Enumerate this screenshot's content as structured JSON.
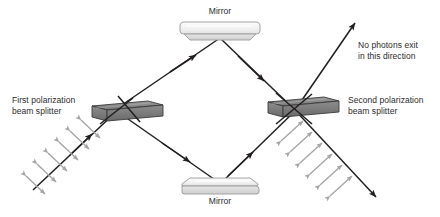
{
  "figure": {
    "background_color": "#ffffff",
    "width": 440,
    "height": 217
  },
  "colors": {
    "beam_line": "#231f20",
    "polarization_arrow": "#a6a6a6",
    "splitter_top_face": "#808080",
    "splitter_front_face": "#707070",
    "splitter_outline": "#3a3a3a",
    "mirror_face": "#f2f2f2",
    "mirror_edge": "#d9d9d9",
    "mirror_outline": "#808080",
    "text": "#2b2b2b"
  },
  "labels": {
    "mirror_top": "Mirror",
    "mirror_bottom": "Mirror",
    "first_splitter_line1": "First polarization",
    "first_splitter_line2": "beam splitter",
    "second_splitter_line1": "Second polarization",
    "second_splitter_line2": "beam splitter",
    "no_photons_line1": "No photons exit",
    "no_photons_line2": "in this direction"
  },
  "components": {
    "first_beam_splitter": {
      "name": "First polarization beam splitter",
      "center_x": 115,
      "center_y": 112
    },
    "second_beam_splitter": {
      "name": "Second polarization beam splitter",
      "center_x": 295,
      "center_y": 110
    },
    "top_mirror": {
      "name": "Mirror",
      "center_x": 220,
      "center_y": 33
    },
    "bottom_mirror": {
      "name": "Mirror",
      "center_x": 220,
      "center_y": 188
    }
  },
  "beams": {
    "input": {
      "name": "input-beam",
      "from": [
        33,
        190
      ],
      "to": [
        115,
        112
      ],
      "polarized": true,
      "arrowhead_at": [
        90,
        135
      ]
    },
    "upper_path_out": {
      "name": "upper-arm-to-top-mirror",
      "from": [
        115,
        112
      ],
      "to": [
        220,
        38
      ],
      "arrowhead_at": [
        193,
        57
      ]
    },
    "upper_path_return": {
      "name": "upper-arm-to-second-splitter",
      "from": [
        220,
        38
      ],
      "to": [
        295,
        110
      ],
      "arrowhead_at": [
        265,
        82
      ]
    },
    "lower_path_out": {
      "name": "lower-arm-to-bottom-mirror",
      "from": [
        115,
        112
      ],
      "to": [
        220,
        183
      ],
      "arrowhead_at": [
        190,
        163
      ]
    },
    "lower_path_return": {
      "name": "lower-arm-to-second-splitter",
      "from": [
        220,
        183
      ],
      "to": [
        295,
        110
      ],
      "arrowhead_at": [
        252,
        145
      ]
    },
    "exit_up": {
      "name": "no-photons-exit-beam",
      "from": [
        295,
        110
      ],
      "to": [
        356,
        22
      ],
      "arrowhead_at": [
        356,
        22
      ],
      "polarized": false
    },
    "exit_down": {
      "name": "output-beam",
      "from": [
        295,
        110
      ],
      "to": [
        375,
        196
      ],
      "arrowhead_at": [
        375,
        196
      ],
      "polarized": true
    }
  },
  "polarization_markers": {
    "input_count": 6,
    "output_count": 6,
    "description": "double-headed gray arrows perpendicular to the beam"
  }
}
